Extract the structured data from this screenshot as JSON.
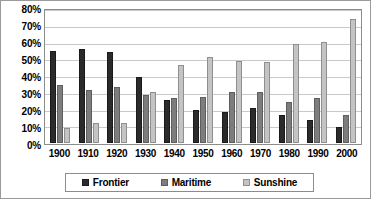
{
  "chart_data": {
    "type": "bar",
    "title": "",
    "subtitle": "",
    "xlabel": "",
    "ylabel": "",
    "categories": [
      "1900",
      "1910",
      "1920",
      "1930",
      "1940",
      "1950",
      "1960",
      "1970",
      "1980",
      "1990",
      "2000"
    ],
    "series": [
      {
        "name": "Frontier",
        "color": "#2b2b2b",
        "values": [
          56,
          57,
          55,
          40,
          26,
          20,
          19,
          21,
          17,
          14,
          10
        ]
      },
      {
        "name": "Maritime",
        "color": "#7d7d7d",
        "values": [
          35,
          32,
          34,
          29,
          27,
          28,
          31,
          31,
          25,
          27,
          17
        ]
      },
      {
        "name": "Sunshine",
        "color": "#c4c4c4",
        "values": [
          9,
          12,
          12,
          31,
          47,
          52,
          50,
          49,
          60,
          61,
          75
        ]
      }
    ],
    "ylim": [
      0,
      80
    ],
    "ytick_labels": [
      "0%",
      "10%",
      "20%",
      "30%",
      "40%",
      "50%",
      "60%",
      "70%",
      "80%"
    ],
    "ytick_values": [
      0,
      10,
      20,
      30,
      40,
      50,
      60,
      70,
      80
    ],
    "grid": true,
    "grid_axis": "y",
    "legend": true,
    "legend_position": "bottom",
    "value_suffix": "%"
  }
}
